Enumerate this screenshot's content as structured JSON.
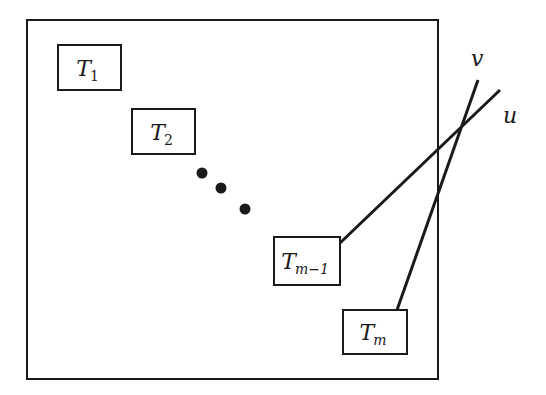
{
  "diagram": {
    "colors": {
      "stroke": "#1a1a1a",
      "background": "#ffffff"
    },
    "frame": {
      "x": 27,
      "y": 20,
      "width": 411,
      "height": 359
    },
    "boxes": [
      {
        "id": "T1",
        "base": "T",
        "subscript": "1",
        "x": 58,
        "y": 45,
        "width": 63,
        "height": 45
      },
      {
        "id": "T2",
        "base": "T",
        "subscript": "2",
        "x": 132,
        "y": 109,
        "width": 63,
        "height": 45
      },
      {
        "id": "Tm-1",
        "base": "T",
        "subscript": "m−1",
        "x": 274,
        "y": 237,
        "width": 66,
        "height": 48
      },
      {
        "id": "Tm",
        "base": "T",
        "subscript": "m",
        "x": 343,
        "y": 310,
        "width": 64,
        "height": 44
      }
    ],
    "ellipsis_dots": [
      {
        "cx": 202,
        "cy": 173
      },
      {
        "cx": 221,
        "cy": 188
      },
      {
        "cx": 245,
        "cy": 209
      }
    ],
    "lines": [
      {
        "label": "u",
        "from": "Tm-1",
        "x1": 340,
        "y1": 243,
        "x2": 500,
        "y2": 90
      },
      {
        "label": "v",
        "from": "Tm",
        "x1": 397,
        "y1": 310,
        "x2": 478,
        "y2": 80
      }
    ],
    "line_labels": {
      "u": {
        "text": "u",
        "x": 503,
        "y": 123
      },
      "v": {
        "text": "v",
        "x": 471,
        "y": 66
      }
    }
  }
}
